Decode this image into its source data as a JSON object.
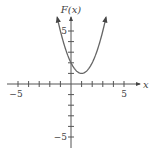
{
  "chart_data": {
    "type": "line",
    "title": "",
    "function": "F(x) = (x - 1)^2 + 1",
    "xlabel": "x",
    "ylabel": "F(x)",
    "xlim": [
      -6,
      6.5
    ],
    "ylim": [
      -6,
      6.5
    ],
    "x_ticks": [
      -5,
      -4,
      -3,
      -2,
      -1,
      1,
      2,
      3,
      4,
      5
    ],
    "y_ticks": [
      -5,
      -4,
      -3,
      -2,
      -1,
      1,
      2,
      3,
      4,
      5
    ],
    "x_tick_labels": [
      {
        "value": -5,
        "text": "−5"
      },
      {
        "value": 5,
        "text": "5"
      }
    ],
    "y_tick_labels": [
      {
        "value": 5,
        "text": "5"
      },
      {
        "value": -5,
        "text": "−5"
      }
    ],
    "grid": false,
    "legend": "none",
    "series": [
      {
        "name": "F(x)",
        "domain": [
          -1.3,
          3.3
        ],
        "vertex": {
          "x": 1,
          "y": 1
        },
        "y_intercept": 2,
        "arrows_at_ends": true,
        "x": [
          -1.3,
          -1,
          -0.5,
          0,
          0.5,
          1,
          1.5,
          2,
          2.5,
          3,
          3.3
        ],
        "values": [
          6.29,
          5,
          3.25,
          2,
          1.25,
          1,
          1.25,
          2,
          3.25,
          5,
          6.29
        ]
      }
    ]
  }
}
